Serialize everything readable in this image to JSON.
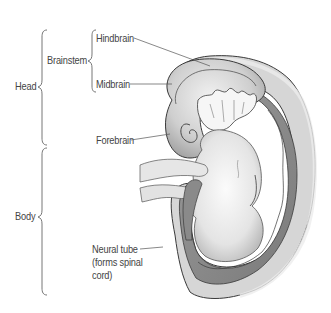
{
  "diagram": {
    "groups": [
      {
        "id": "head",
        "label": "Head"
      },
      {
        "id": "body",
        "label": "Body"
      },
      {
        "id": "brainstem",
        "label": "Brainstem"
      }
    ],
    "labels": {
      "hindbrain": "Hindbrain",
      "midbrain": "Midbrain",
      "forebrain": "Forebrain",
      "neural_tube_line1": "Neural tube",
      "neural_tube_line2": "(forms spinal",
      "neural_tube_line3": "cord)"
    },
    "colors": {
      "text": "#444444",
      "leader_line": "#555555",
      "brace": "#666666",
      "skin_light": "#eeeeee",
      "skin_mid": "#c8c8c8",
      "neural_tube": "#8c8c8c",
      "outline": "#3a3a3a"
    }
  }
}
